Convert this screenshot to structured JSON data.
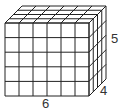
{
  "figure": {
    "type": "rectangular prism made of unit cubes",
    "dimensions": {
      "length": 6,
      "height": 5,
      "depth": 4
    },
    "labels": {
      "length": "6",
      "height": "5",
      "depth": "4"
    },
    "stroke_color": "#222222"
  }
}
